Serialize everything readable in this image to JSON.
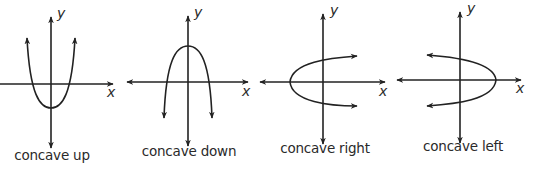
{
  "colors": {
    "stroke": "#222222",
    "text": "#2a2a2a",
    "background": "#ffffff"
  },
  "panels": [
    {
      "id": "up",
      "caption": "concave up",
      "x_label": "x",
      "y_label": "y",
      "direction": "up"
    },
    {
      "id": "down",
      "caption": "concave down",
      "x_label": "x",
      "y_label": "y",
      "direction": "down"
    },
    {
      "id": "right",
      "caption": "concave right",
      "x_label": "x",
      "y_label": "y",
      "direction": "right"
    },
    {
      "id": "left",
      "caption": "concave left",
      "x_label": "x",
      "y_label": "y",
      "direction": "left"
    }
  ]
}
